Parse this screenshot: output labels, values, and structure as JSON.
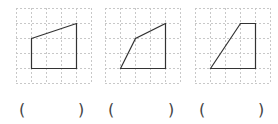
{
  "grid": {
    "cols": 5,
    "rows": 5,
    "cell_px": 15,
    "line_color": "#c8c8c8",
    "shape_color": "#333333"
  },
  "figures": [
    {
      "label": "figure-1",
      "vertices": [
        [
          1,
          2
        ],
        [
          4,
          1
        ],
        [
          4,
          4
        ],
        [
          1,
          4
        ]
      ],
      "answer_open": "(",
      "answer_close": ")"
    },
    {
      "label": "figure-2",
      "vertices": [
        [
          1,
          4
        ],
        [
          2,
          2
        ],
        [
          4,
          1
        ],
        [
          4,
          4
        ]
      ],
      "answer_open": "(",
      "answer_close": ")"
    },
    {
      "label": "figure-3",
      "vertices": [
        [
          1,
          4
        ],
        [
          3,
          1
        ],
        [
          4,
          1
        ],
        [
          4,
          4
        ]
      ],
      "answer_open": "(",
      "answer_close": ")"
    }
  ]
}
